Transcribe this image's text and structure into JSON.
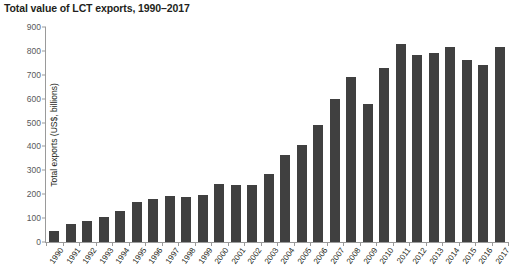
{
  "chart_data": {
    "type": "bar",
    "title": "Total value of LCT exports, 1990–2017",
    "xlabel": "",
    "ylabel": "Total exports (US$, billions)",
    "ylim": [
      0,
      900
    ],
    "yticks": [
      0,
      100,
      200,
      300,
      400,
      500,
      600,
      700,
      800,
      900
    ],
    "grid": false,
    "legend": null,
    "bar_color": "#404040",
    "categories": [
      "1990",
      "1991",
      "1992",
      "1993",
      "1994",
      "1995",
      "1996",
      "1997",
      "1998",
      "1999",
      "2000",
      "2001",
      "2002",
      "2003",
      "2004",
      "2005",
      "2006",
      "2007",
      "2008",
      "2009",
      "2010",
      "2011",
      "2012",
      "2013",
      "2014",
      "2015",
      "2016",
      "2017"
    ],
    "values": [
      45,
      75,
      88,
      103,
      130,
      168,
      180,
      192,
      190,
      197,
      243,
      240,
      238,
      285,
      365,
      405,
      488,
      598,
      690,
      578,
      730,
      830,
      782,
      790,
      815,
      762,
      742,
      815
    ]
  }
}
